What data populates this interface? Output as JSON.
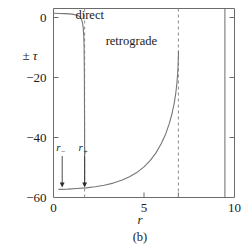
{
  "chart_data": {
    "type": "line",
    "title": "",
    "caption": "(b)",
    "xlabel": "r",
    "ylabel": "± τ",
    "xlim": [
      0,
      10
    ],
    "ylim": [
      -60,
      3
    ],
    "grid": false,
    "legend": "none",
    "x_ticks": [
      {
        "value": 0,
        "label": "0"
      },
      {
        "value": 5,
        "label": "5"
      },
      {
        "value": 6.9,
        "label": ""
      },
      {
        "value": 10,
        "label": "10"
      }
    ],
    "y_ticks": [
      {
        "value": 0,
        "label": "0"
      },
      {
        "value": -20,
        "label": "−20"
      },
      {
        "value": -40,
        "label": "−40"
      },
      {
        "value": -60,
        "label": "−60"
      }
    ],
    "annotations": [
      {
        "name": "direct",
        "text": "direct",
        "x": 2.0,
        "y": -0.5
      },
      {
        "name": "retrograde",
        "text": "retrograde",
        "x": 4.3,
        "y": -9.0
      }
    ],
    "markers": [
      {
        "name": "r-minus",
        "label": "r",
        "subscript": "−",
        "x": 0.48,
        "y_label": -44.5,
        "y_tip": -56.5
      },
      {
        "name": "r-plus",
        "label": "r",
        "subscript": "+",
        "x": 1.72,
        "y_label": -44.5,
        "y_tip": -56.5
      }
    ],
    "vertical_dashed_lines": [
      {
        "name": "asymptote-r-plus",
        "x": 1.72
      },
      {
        "name": "asymptote-retrograde",
        "x": 6.9
      }
    ],
    "inner_right_line": {
      "name": "inner-right-boundary",
      "x": 9.47
    },
    "series": [
      {
        "name": "direct",
        "points": [
          [
            0.02,
            1.4
          ],
          [
            0.3,
            1.35
          ],
          [
            0.6,
            1.3
          ],
          [
            0.9,
            1.2
          ],
          [
            1.1,
            1.05
          ],
          [
            1.25,
            0.85
          ],
          [
            1.38,
            0.55
          ],
          [
            1.48,
            0.1
          ],
          [
            1.55,
            -0.7
          ],
          [
            1.6,
            -1.8
          ],
          [
            1.64,
            -3.4
          ],
          [
            1.67,
            -6.0
          ],
          [
            1.69,
            -10.0
          ],
          [
            1.705,
            -18.0
          ],
          [
            1.715,
            -34.0
          ],
          [
            1.72,
            -56.0
          ]
        ]
      },
      {
        "name": "retrograde",
        "points": [
          [
            0.3,
            -57.3
          ],
          [
            0.8,
            -57.2
          ],
          [
            1.3,
            -57.0
          ],
          [
            1.8,
            -56.8
          ],
          [
            2.3,
            -56.4
          ],
          [
            2.8,
            -55.9
          ],
          [
            3.3,
            -55.2
          ],
          [
            3.8,
            -54.2
          ],
          [
            4.2,
            -53.1
          ],
          [
            4.6,
            -51.7
          ],
          [
            5.0,
            -49.8
          ],
          [
            5.35,
            -47.6
          ],
          [
            5.65,
            -45.2
          ],
          [
            5.95,
            -42.1
          ],
          [
            6.2,
            -38.8
          ],
          [
            6.4,
            -35.3
          ],
          [
            6.55,
            -32.0
          ],
          [
            6.68,
            -28.2
          ],
          [
            6.76,
            -25.0
          ],
          [
            6.82,
            -21.8
          ],
          [
            6.86,
            -18.6
          ],
          [
            6.885,
            -15.8
          ],
          [
            6.9,
            -12.8
          ],
          [
            6.905,
            -11.2
          ]
        ]
      }
    ]
  }
}
